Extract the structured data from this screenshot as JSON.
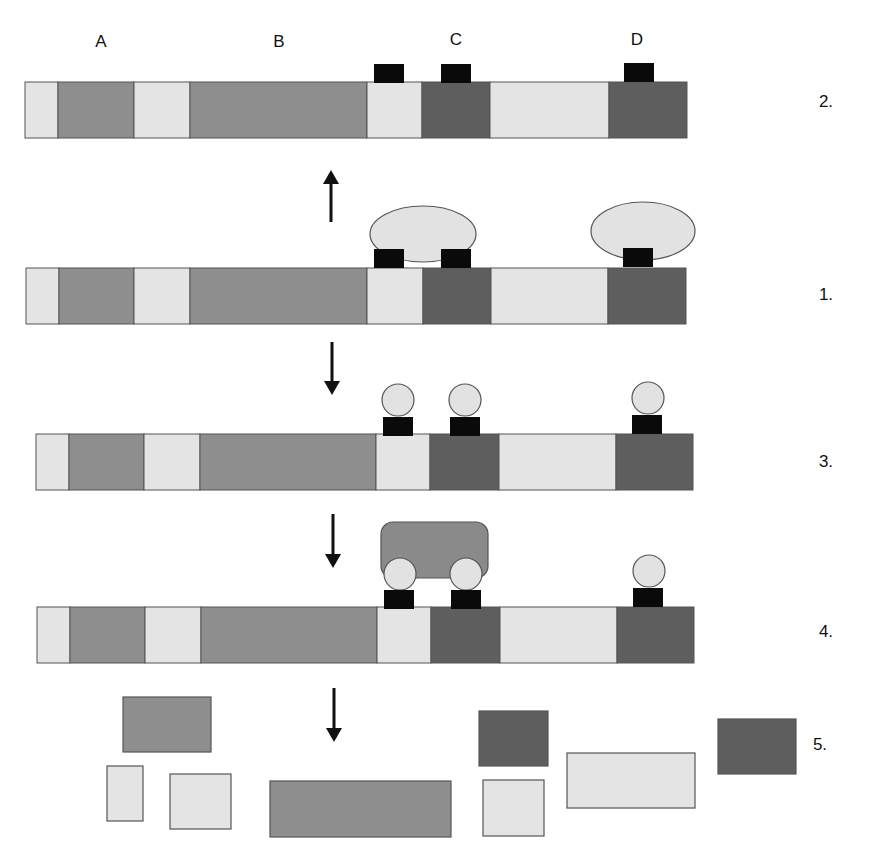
{
  "colors": {
    "light": "#e4e4e4",
    "medium": "#8e8e8e",
    "dark": "#5e5e5e",
    "black": "#0a0a0a",
    "outline": "#555555",
    "bubble": "#e2e2e2",
    "complex": "#8a8a8a"
  },
  "column_labels": [
    {
      "text": "A",
      "x": 101,
      "y": 47
    },
    {
      "text": "B",
      "x": 279,
      "y": 47
    },
    {
      "text": "C",
      "x": 456,
      "y": 45
    },
    {
      "text": "D",
      "x": 637,
      "y": 45
    }
  ],
  "rows": [
    {
      "id": "row-2",
      "step": "2.",
      "step_x": 826,
      "step_y": 107,
      "x": 25,
      "y": 82,
      "h": 56,
      "segments": [
        {
          "w": 33,
          "tone": "light"
        },
        {
          "w": 76,
          "tone": "medium"
        },
        {
          "w": 56,
          "tone": "light"
        },
        {
          "w": 177,
          "tone": "medium"
        },
        {
          "w": 55,
          "tone": "light"
        },
        {
          "w": 68,
          "tone": "dark"
        },
        {
          "w": 119,
          "tone": "light"
        },
        {
          "w": 78,
          "tone": "dark"
        }
      ],
      "marks": [
        {
          "x": 374,
          "y": 64,
          "w": 30,
          "h": 19
        },
        {
          "x": 441,
          "y": 64,
          "w": 30,
          "h": 19
        },
        {
          "x": 624,
          "y": 63,
          "w": 30,
          "h": 19
        }
      ],
      "bubbles": [],
      "complex": null
    },
    {
      "id": "row-1",
      "step": "1.",
      "step_x": 826,
      "step_y": 300,
      "x": 26,
      "y": 268,
      "h": 56,
      "segments": [
        {
          "w": 33,
          "tone": "light"
        },
        {
          "w": 75,
          "tone": "medium"
        },
        {
          "w": 56,
          "tone": "light"
        },
        {
          "w": 177,
          "tone": "medium"
        },
        {
          "w": 56,
          "tone": "light"
        },
        {
          "w": 68,
          "tone": "dark"
        },
        {
          "w": 117,
          "tone": "light"
        },
        {
          "w": 78,
          "tone": "dark"
        }
      ],
      "marks": [
        {
          "x": 374,
          "y": 249,
          "w": 30,
          "h": 19
        },
        {
          "x": 441,
          "y": 249,
          "w": 30,
          "h": 19
        },
        {
          "x": 623,
          "y": 248,
          "w": 30,
          "h": 19
        }
      ],
      "ellipses": [
        {
          "cx": 423,
          "cy": 234,
          "rx": 53,
          "ry": 28
        },
        {
          "cx": 643,
          "cy": 231,
          "rx": 52,
          "ry": 29
        }
      ],
      "bubbles": [],
      "complex": null
    },
    {
      "id": "row-3",
      "step": "3.",
      "step_x": 826,
      "step_y": 467,
      "x": 36,
      "y": 434,
      "h": 56,
      "segments": [
        {
          "w": 33,
          "tone": "light"
        },
        {
          "w": 75,
          "tone": "medium"
        },
        {
          "w": 56,
          "tone": "light"
        },
        {
          "w": 176,
          "tone": "medium"
        },
        {
          "w": 54,
          "tone": "light"
        },
        {
          "w": 69,
          "tone": "dark"
        },
        {
          "w": 117,
          "tone": "light"
        },
        {
          "w": 77,
          "tone": "dark"
        }
      ],
      "marks": [
        {
          "x": 383,
          "y": 417,
          "w": 30,
          "h": 19
        },
        {
          "x": 450,
          "y": 417,
          "w": 30,
          "h": 19
        },
        {
          "x": 632,
          "y": 415,
          "w": 30,
          "h": 19
        }
      ],
      "bubbles": [
        {
          "cx": 398,
          "cy": 400,
          "r": 16
        },
        {
          "cx": 465,
          "cy": 400,
          "r": 16
        },
        {
          "cx": 648,
          "cy": 398,
          "r": 16
        }
      ],
      "complex": null
    },
    {
      "id": "row-4",
      "step": "4.",
      "step_x": 826,
      "step_y": 637,
      "x": 37,
      "y": 607,
      "h": 56,
      "segments": [
        {
          "w": 33,
          "tone": "light"
        },
        {
          "w": 75,
          "tone": "medium"
        },
        {
          "w": 56,
          "tone": "light"
        },
        {
          "w": 176,
          "tone": "medium"
        },
        {
          "w": 54,
          "tone": "light"
        },
        {
          "w": 69,
          "tone": "dark"
        },
        {
          "w": 117,
          "tone": "light"
        },
        {
          "w": 77,
          "tone": "dark"
        }
      ],
      "marks": [
        {
          "x": 384,
          "y": 590,
          "w": 30,
          "h": 19
        },
        {
          "x": 451,
          "y": 590,
          "w": 30,
          "h": 19
        },
        {
          "x": 633,
          "y": 588,
          "w": 30,
          "h": 19
        }
      ],
      "bubbles": [
        {
          "cx": 400,
          "cy": 574,
          "r": 16
        },
        {
          "cx": 466,
          "cy": 574,
          "r": 16
        },
        {
          "cx": 649,
          "cy": 571,
          "r": 16
        }
      ],
      "complex": {
        "x": 381,
        "y": 522,
        "w": 107,
        "h": 56,
        "rx": 12
      }
    }
  ],
  "arrows": [
    {
      "id": "arrow-1-to-2",
      "x": 331,
      "y1": 222,
      "y2": 170,
      "dir": "up"
    },
    {
      "id": "arrow-1-to-3",
      "x": 332,
      "y1": 342,
      "y2": 395,
      "dir": "down"
    },
    {
      "id": "arrow-3-to-4",
      "x": 333,
      "y1": 514,
      "y2": 568,
      "dir": "down"
    },
    {
      "id": "arrow-4-to-5",
      "x": 334,
      "y1": 688,
      "y2": 742,
      "dir": "down"
    }
  ],
  "fragments": {
    "step": "5.",
    "step_x": 820,
    "step_y": 750,
    "blocks": [
      {
        "x": 123,
        "y": 697,
        "w": 88,
        "h": 55,
        "tone": "medium"
      },
      {
        "x": 107,
        "y": 766,
        "w": 36,
        "h": 55,
        "tone": "light"
      },
      {
        "x": 170,
        "y": 774,
        "w": 61,
        "h": 55,
        "tone": "light"
      },
      {
        "x": 270,
        "y": 781,
        "w": 181,
        "h": 56,
        "tone": "medium"
      },
      {
        "x": 479,
        "y": 711,
        "w": 69,
        "h": 55,
        "tone": "dark"
      },
      {
        "x": 483,
        "y": 780,
        "w": 61,
        "h": 56,
        "tone": "light"
      },
      {
        "x": 567,
        "y": 753,
        "w": 128,
        "h": 55,
        "tone": "light"
      },
      {
        "x": 718,
        "y": 719,
        "w": 78,
        "h": 55,
        "tone": "dark"
      }
    ]
  }
}
